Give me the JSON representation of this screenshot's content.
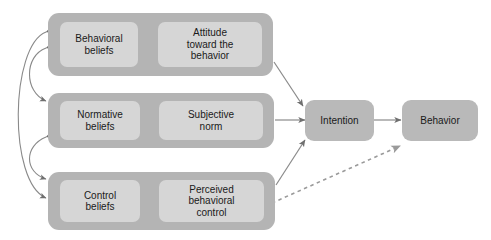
{
  "diagram": {
    "colors": {
      "panel_fill": "#b4b4b4",
      "node_fill": "#d6d6d6",
      "outcome_fill": "#b9b9b9",
      "arrow_dark": "#6f6f6f",
      "arrow_light": "#c0c0c0",
      "background": "#ffffff",
      "text": "#1a1a1a"
    },
    "groups": [
      {
        "id": "behavioral",
        "belief_label": "Behavioral\nbeliefs",
        "construct_label": "Attitude\ntoward the\nbehavior"
      },
      {
        "id": "normative",
        "belief_label": "Normative\nbeliefs",
        "construct_label": "Subjective\nnorm"
      },
      {
        "id": "control",
        "belief_label": "Control\nbeliefs",
        "construct_label": "Perceived\nbehavioral\ncontrol"
      }
    ],
    "outcomes": [
      {
        "id": "intention",
        "label": "Intention"
      },
      {
        "id": "behavior",
        "label": "Behavior"
      }
    ],
    "connectors": [
      {
        "name": "behavioral-beliefs-to-attitude",
        "style": "solid-light"
      },
      {
        "name": "normative-beliefs-to-subjective-norm",
        "style": "solid-light"
      },
      {
        "name": "control-beliefs-to-perceived-control",
        "style": "solid-light"
      },
      {
        "name": "attitude-to-intention",
        "style": "solid"
      },
      {
        "name": "subjective-norm-to-intention",
        "style": "solid"
      },
      {
        "name": "perceived-control-to-intention",
        "style": "solid"
      },
      {
        "name": "intention-to-behavior",
        "style": "solid"
      },
      {
        "name": "perceived-control-to-behavior",
        "style": "dashed"
      },
      {
        "name": "behavioral-normative-correlation",
        "style": "curved-double"
      },
      {
        "name": "normative-control-correlation",
        "style": "curved-double"
      },
      {
        "name": "behavioral-control-correlation",
        "style": "curved-double"
      }
    ]
  }
}
